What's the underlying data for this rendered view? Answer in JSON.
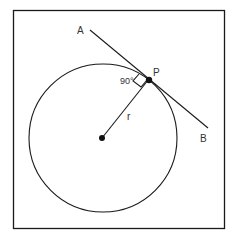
{
  "diagram": {
    "labels": {
      "point_a": "A",
      "point_b": "B",
      "point_p": "P",
      "radius": "r",
      "angle": "90°"
    },
    "colors": {
      "stroke": "#1a1a1a",
      "text": "#333333",
      "background": "#ffffff"
    }
  }
}
